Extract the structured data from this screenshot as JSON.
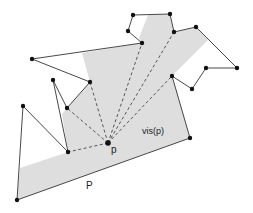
{
  "diagram": {
    "labels": {
      "point": "p",
      "region": "vis(p)",
      "polygon": "P"
    },
    "colors": {
      "background": "#ffffff",
      "visible_fill": "#dedede",
      "edge": "#333333",
      "vertex": "#111111",
      "dashed": "#555555"
    },
    "point_p": [
      108,
      143
    ],
    "polygon_vertices": [
      [
        17,
        200
      ],
      [
        23,
        106
      ],
      [
        68,
        152
      ],
      [
        53,
        80
      ],
      [
        67,
        108
      ],
      [
        90,
        82
      ],
      [
        32,
        59
      ],
      [
        142,
        43
      ],
      [
        128,
        31
      ],
      [
        133,
        15
      ],
      [
        170,
        14
      ],
      [
        174,
        32
      ],
      [
        196,
        27
      ],
      [
        237,
        68
      ],
      [
        206,
        68
      ],
      [
        192,
        89
      ],
      [
        172,
        76
      ],
      [
        190,
        138
      ]
    ],
    "visibility_region": [
      [
        17,
        200
      ],
      [
        20,
        168
      ],
      [
        68,
        152
      ],
      [
        62,
        114
      ],
      [
        67,
        108
      ],
      [
        90,
        82
      ],
      [
        82,
        53
      ],
      [
        142,
        43
      ],
      [
        139,
        38
      ],
      [
        148,
        15
      ],
      [
        170,
        14
      ],
      [
        174,
        32
      ],
      [
        196,
        27
      ],
      [
        208,
        40
      ],
      [
        172,
        76
      ],
      [
        190,
        138
      ]
    ],
    "sight_lines": [
      [
        [
          108,
          143
        ],
        [
          68,
          152
        ]
      ],
      [
        [
          108,
          143
        ],
        [
          67,
          108
        ]
      ],
      [
        [
          108,
          143
        ],
        [
          90,
          82
        ]
      ],
      [
        [
          108,
          143
        ],
        [
          142,
          43
        ]
      ],
      [
        [
          108,
          143
        ],
        [
          174,
          32
        ]
      ],
      [
        [
          108,
          143
        ],
        [
          172,
          76
        ]
      ]
    ]
  }
}
